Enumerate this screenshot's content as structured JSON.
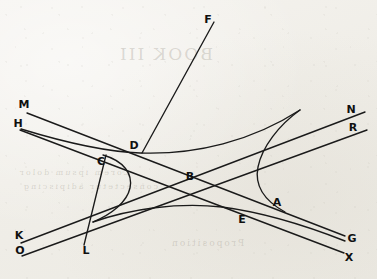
{
  "figure": {
    "background_color": "#f3f1ec",
    "ink_color": "#1a1a1a",
    "width": 377,
    "height": 279,
    "labels": [
      {
        "id": "F",
        "text": "F",
        "x": 208,
        "y": 20
      },
      {
        "id": "M",
        "text": "M",
        "x": 24,
        "y": 105
      },
      {
        "id": "N",
        "text": "N",
        "x": 351,
        "y": 110
      },
      {
        "id": "H",
        "text": "H",
        "x": 18,
        "y": 124
      },
      {
        "id": "R",
        "text": "R",
        "x": 353,
        "y": 128
      },
      {
        "id": "D",
        "text": "D",
        "x": 134,
        "y": 146
      },
      {
        "id": "C",
        "text": "C",
        "x": 101,
        "y": 162
      },
      {
        "id": "B",
        "text": "B",
        "x": 190,
        "y": 177
      },
      {
        "id": "A",
        "text": "A",
        "x": 277,
        "y": 203
      },
      {
        "id": "E",
        "text": "E",
        "x": 242,
        "y": 220
      },
      {
        "id": "K",
        "text": "K",
        "x": 19,
        "y": 236
      },
      {
        "id": "G",
        "text": "G",
        "x": 352,
        "y": 239
      },
      {
        "id": "O",
        "text": "O",
        "x": 20,
        "y": 251
      },
      {
        "id": "L",
        "text": "L",
        "x": 86,
        "y": 251
      },
      {
        "id": "X",
        "text": "X",
        "x": 349,
        "y": 258
      }
    ],
    "strokes": [
      {
        "id": "line-M-G",
        "kind": "line",
        "from": "M",
        "to": "G",
        "description": "Straight asymptote from M through D and B to G",
        "d": "M 27 113 L 345 236"
      },
      {
        "id": "line-H-X",
        "kind": "line",
        "from": "H",
        "to": "X",
        "description": "Straight asymptote from H through C and E to X",
        "d": "M 20 130 L 344 253"
      },
      {
        "id": "line-K-N",
        "kind": "line",
        "from": "K",
        "to": "N",
        "description": "Straight asymptote from K rising through B to N",
        "d": "M 21 243 L 365 112"
      },
      {
        "id": "line-O-R",
        "kind": "curve",
        "from": "O",
        "to": "R",
        "description": "Lower-left ray from O rising through E toward R",
        "d": "M 22 256 L 367 130"
      },
      {
        "id": "line-F-D",
        "kind": "line",
        "from": "F",
        "to": "D",
        "description": "Transversal from F descending to the point D",
        "d": "M 214 22 L 142 153"
      },
      {
        "id": "line-C-L",
        "kind": "line",
        "from": "C",
        "to": "L",
        "description": "Short transversal from C descending to L",
        "d": "M 106 155 L 84 245"
      },
      {
        "id": "hyperbola-upper-left",
        "kind": "curve",
        "description": "Upper hyperbola branch from H side sweeping right through D toward N/R",
        "d": "M 21 129 C 70 144 112 152 140 153 C 196 155 252 141 300 110"
      },
      {
        "id": "hyperbola-left-branch",
        "kind": "curve",
        "description": "Left hyperbola branch, vertex pointing right near x=131, passing through C",
        "d": "M 103 155 C 124 161 133 174 130 188 C 127 202 112 214 93 222"
      },
      {
        "id": "hyperbola-right-branch",
        "kind": "curve",
        "description": "Right hyperbola branch, vertex pointing left near x=258, passing through A",
        "d": "M 300 110 C 279 125 262 147 258 167 C 254 187 265 201 285 212"
      },
      {
        "id": "hyperbola-lower",
        "kind": "curve",
        "description": "Lower hyperbola branch sweeping from lower-left up through E toward G",
        "d": "M 93 222 C 130 209 178 202 222 207 C 268 213 312 228 345 241"
      }
    ]
  },
  "bleed_through": {
    "heading": "BOOK III",
    "line_a": "Lorem ipsum dolor",
    "line_b": "consectetur adipiscing",
    "line_c": "Proposition"
  }
}
